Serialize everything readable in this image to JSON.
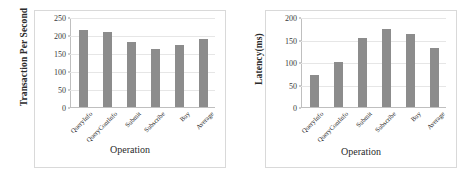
{
  "figure": {
    "panel_count": 2,
    "bar_color": "#8c8c8c",
    "background_color": "#ffffff",
    "frame_color": "#d9d9d9",
    "gridline_color": "#e6e6e6"
  },
  "charts": [
    {
      "id": "throughput-chart",
      "ylabel": "Transaction Per Second",
      "xlabel": "Operation",
      "yticks": [
        "250",
        "200",
        "150",
        "100",
        "50",
        "0"
      ],
      "categories": [
        "QueryInfo",
        "QueryContInfo",
        "Submit",
        "Subscribe",
        "Buy",
        "Average"
      ],
      "values": [
        215,
        212,
        184,
        163,
        175,
        190
      ]
    },
    {
      "id": "latency-chart",
      "ylabel": "Latency(ms)",
      "xlabel": "Operation",
      "yticks": [
        "200",
        "150",
        "100",
        "50",
        "0"
      ],
      "categories": [
        "QueryInfo",
        "QueryContInfo",
        "Submit",
        "Subscribe",
        "Buy",
        "Average"
      ],
      "values": [
        73,
        101,
        155,
        176,
        163,
        133
      ]
    }
  ],
  "chart_data": [
    {
      "type": "bar",
      "title": "",
      "subtitle": "",
      "categories": [
        "QueryInfo",
        "QueryContInfo",
        "Submit",
        "Subscribe",
        "Buy",
        "Average"
      ],
      "values": [
        215,
        212,
        184,
        163,
        175,
        190
      ],
      "xlabel": "Operation",
      "ylabel": "Transaction Per Second",
      "ylim": [
        0,
        250
      ],
      "yticks": [
        0,
        50,
        100,
        150,
        200,
        250
      ],
      "grid": true,
      "legend": false,
      "bar_color": "#8c8c8c",
      "xtick_rotation": -45
    },
    {
      "type": "bar",
      "title": "",
      "subtitle": "",
      "categories": [
        "QueryInfo",
        "QueryContInfo",
        "Submit",
        "Subscribe",
        "Buy",
        "Average"
      ],
      "values": [
        73,
        101,
        155,
        176,
        163,
        133
      ],
      "xlabel": "Operation",
      "ylabel": "Latency(ms)",
      "ylim": [
        0,
        200
      ],
      "yticks": [
        0,
        50,
        100,
        150,
        200
      ],
      "grid": true,
      "legend": false,
      "bar_color": "#8c8c8c",
      "xtick_rotation": -45
    }
  ]
}
